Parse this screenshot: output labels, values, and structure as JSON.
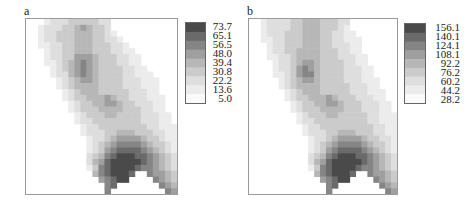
{
  "palette": [
    "#fafafa",
    "#ececec",
    "#dedede",
    "#cbcbcb",
    "#b7b7b7",
    "#9f9f9f",
    "#858585",
    "#6a6a6a",
    "#4a4a4a"
  ],
  "chart_data": [
    {
      "type": "heatmap",
      "title": "a",
      "legend": {
        "labels": [
          "73.7",
          "65.1",
          "56.5",
          "48.0",
          "39.4",
          "30.8",
          "22.2",
          "13.6",
          "5.0"
        ],
        "range": [
          5.0,
          73.7
        ]
      },
      "grid_cols": 25,
      "grid_rows": 30,
      "description": "Diagonal band from top-center toward lower-right; maxima at lower-right bowl (~65-73.7), secondary highs near upper-middle (~39-48).",
      "rows": [
        "0001222333332200000000000",
        "0012223345433200000000000",
        "0012233344433210000000000",
        "0012233344433221000000000",
        "0011223344433322100000000",
        "0001223344433322110000000",
        "0001223355543332211000000",
        "0001123456543332211000000",
        "0000123456543333221100000",
        "0000122456543333221110000",
        "0000012345543333222111000",
        "0000012344443333222111000",
        "0000001234443333322211000",
        "0000001233444543322211100",
        "0000000123344554332221100",
        "0000000123334444333221100",
        "0000000012333443333222110",
        "0000000012233333333222110",
        "0000000001223333333322111",
        "0000000001222334443332211",
        "0000000000122345555433211",
        "0000000000123456666543321",
        "0000000000123567777654321",
        "0000000000234678887765432",
        "0000000000245788888765432",
        "0000000000136788887665432",
        "0000000000046788870065543",
        "0000000000005678800006543",
        "0000000000000670000000654",
        "0000000000000600000000065"
      ]
    },
    {
      "type": "heatmap",
      "title": "b",
      "legend": {
        "labels": [
          "156.1",
          "140.1",
          "124.1",
          "108.1",
          "92.2",
          "76.2",
          "60.2",
          "44.2",
          "28.2"
        ],
        "range": [
          28.2,
          156.1
        ]
      },
      "grid_cols": 25,
      "grid_rows": 30,
      "description": "Same spatial pattern as a with higher values; maximum ~140-156 in lower-right bowl, secondary high ~92-108 in middle band.",
      "rows": [
        "0012222334443332200000000",
        "0012222334443332100000000",
        "0012223334443322110000000",
        "0011223334443322111000000",
        "0001223334443322211000000",
        "0001223344443332211000000",
        "0001122344443332221100000",
        "0000122345543333221100000",
        "0000122356543333222110000",
        "0000112356643333222110000",
        "0000012345543333222111000",
        "0000012344443333322211000",
        "0000001234443333322211100",
        "0000001233444543332221100",
        "0000000123344554333222110",
        "0000000123334444333222110",
        "0000000012333443333322111",
        "0000000012233333333322111",
        "0000000001223333333332211",
        "0000000001222334443332211",
        "0000000000122345555433221",
        "0000000000123456666543321",
        "0000000000123567777654321",
        "0000000000234678887765432",
        "0000000000245788888765432",
        "0000000000136788887665432",
        "0000000000046788870065543",
        "0000000000005678800006543",
        "0000000000000670000000654",
        "0000000000000600000000065"
      ]
    }
  ],
  "panels": [
    {
      "label": "a"
    },
    {
      "label": "b"
    }
  ]
}
